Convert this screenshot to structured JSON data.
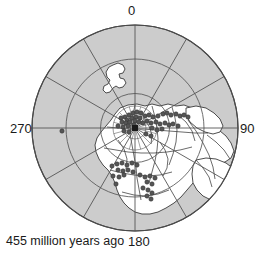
{
  "figure": {
    "type": "polar-paleogeographic-map",
    "caption": "455 million years ago",
    "projection": "polar azimuthal",
    "pole_marker": "square"
  },
  "axis": {
    "labels": [
      {
        "name": "north",
        "text": "0",
        "angle_deg": 0
      },
      {
        "name": "east",
        "text": "90",
        "angle_deg": 90
      },
      {
        "name": "south",
        "text": "180",
        "angle_deg": 180
      },
      {
        "name": "west",
        "text": "270",
        "angle_deg": 270
      }
    ]
  },
  "colors": {
    "ocean": "#cccccc",
    "land": "#ffffff",
    "outline": "#4a4a4a",
    "grid": "#555555",
    "coast": "#3a3a3a",
    "point": "#555555",
    "text": "#1a1a1a",
    "background": "#ffffff"
  },
  "geometry": {
    "center_x": 135,
    "center_y": 128,
    "radius": 103,
    "grid_circles": [
      34.5,
      69,
      103
    ],
    "radial_lines_deg": [
      0,
      30,
      60,
      90,
      120,
      150,
      180,
      210,
      240,
      270,
      300,
      330
    ],
    "inner_fine_circles": [
      11,
      22
    ],
    "inner_fine_radials_deg": [
      15,
      45,
      75,
      105,
      135,
      165,
      195,
      225,
      255,
      285,
      315,
      345
    ]
  },
  "chart_data": {
    "type": "scatter",
    "title": "455 million years ago",
    "xlabel": "",
    "ylabel": "",
    "coordinate_system": "polar",
    "theta_ticks": [
      0,
      90,
      180,
      270
    ],
    "theta_tick_labels": [
      "0",
      "90",
      "180",
      "270"
    ],
    "r_gridlines": [
      1,
      2,
      3
    ],
    "series": [
      {
        "name": "fossil-localities",
        "marker": "circle",
        "color": "#555555",
        "points_px": [
          [
            133,
            113
          ],
          [
            137,
            112
          ],
          [
            141,
            113
          ],
          [
            129,
            115
          ],
          [
            125,
            117
          ],
          [
            121,
            118
          ],
          [
            127,
            120
          ],
          [
            132,
            118
          ],
          [
            136,
            117
          ],
          [
            140,
            118
          ],
          [
            145,
            116
          ],
          [
            149,
            115
          ],
          [
            153,
            117
          ],
          [
            158,
            116
          ],
          [
            163,
            114
          ],
          [
            167,
            113
          ],
          [
            171,
            115
          ],
          [
            176,
            114
          ],
          [
            180,
            116
          ],
          [
            184,
            115
          ],
          [
            188,
            117
          ],
          [
            122,
            122
          ],
          [
            126,
            123
          ],
          [
            130,
            122
          ],
          [
            135,
            121
          ],
          [
            139,
            122
          ],
          [
            143,
            123
          ],
          [
            147,
            121
          ],
          [
            151,
            123
          ],
          [
            156,
            122
          ],
          [
            160,
            124
          ],
          [
            165,
            123
          ],
          [
            169,
            125
          ],
          [
            173,
            124
          ],
          [
            178,
            126
          ],
          [
            118,
            126
          ],
          [
            123,
            127
          ],
          [
            128,
            126
          ],
          [
            134,
            125
          ],
          [
            152,
            128
          ],
          [
            157,
            130
          ],
          [
            162,
            129
          ],
          [
            146,
            134
          ],
          [
            151,
            136
          ],
          [
            124,
            131
          ],
          [
            129,
            132
          ],
          [
            112,
            166
          ],
          [
            117,
            164
          ],
          [
            122,
            163
          ],
          [
            127,
            165
          ],
          [
            132,
            163
          ],
          [
            137,
            165
          ],
          [
            118,
            170
          ],
          [
            123,
            171
          ],
          [
            128,
            170
          ],
          [
            133,
            172
          ],
          [
            113,
            176
          ],
          [
            119,
            177
          ],
          [
            124,
            175
          ],
          [
            140,
            175
          ],
          [
            145,
            177
          ],
          [
            150,
            176
          ],
          [
            155,
            178
          ],
          [
            147,
            182
          ],
          [
            152,
            184
          ],
          [
            143,
            188
          ],
          [
            148,
            190
          ],
          [
            152,
            193
          ],
          [
            147,
            196
          ],
          [
            151,
            199
          ],
          [
            116,
            184
          ],
          [
            62,
            131
          ]
        ]
      }
    ]
  }
}
